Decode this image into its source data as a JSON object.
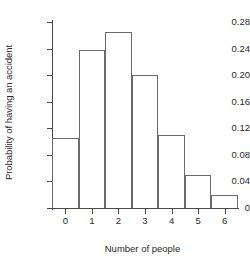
{
  "chart_data": {
    "type": "bar",
    "title": "",
    "subtitle": "",
    "xlabel": "Number of people",
    "ylabel": "Probability of having an accident",
    "categories": [
      "0",
      "1",
      "2",
      "3",
      "4",
      "5",
      "6"
    ],
    "values": [
      0.105,
      0.238,
      0.265,
      0.2,
      0.11,
      0.05,
      0.02
    ],
    "series": [
      {
        "name": "Probability of having an accident",
        "values": [
          0.105,
          0.238,
          0.265,
          0.2,
          0.11,
          0.05,
          0.02
        ]
      }
    ],
    "xlim": [
      -0.5,
      6.5
    ],
    "ylim": [
      0,
      0.28
    ],
    "ytick_labels": [
      "0",
      "0.04",
      "0.08",
      "0.12",
      "0.16",
      "0.20",
      "0.24",
      "0.28"
    ],
    "ytick_values": [
      0,
      0.04,
      0.08,
      0.12,
      0.16,
      0.2,
      0.24,
      0.28
    ],
    "xtick_labels": [
      "0",
      "1",
      "2",
      "3",
      "4",
      "5",
      "6"
    ],
    "xtick_values": [
      0,
      1,
      2,
      3,
      4,
      5,
      6
    ],
    "grid": false,
    "legend": false,
    "legend_position": "none",
    "bar_style": "outline",
    "bar_fill_color": "#ffffff",
    "bar_edge_color": "#6b6b6b",
    "axis_color": "#4a4a4a",
    "background_color": "#ffffff"
  }
}
